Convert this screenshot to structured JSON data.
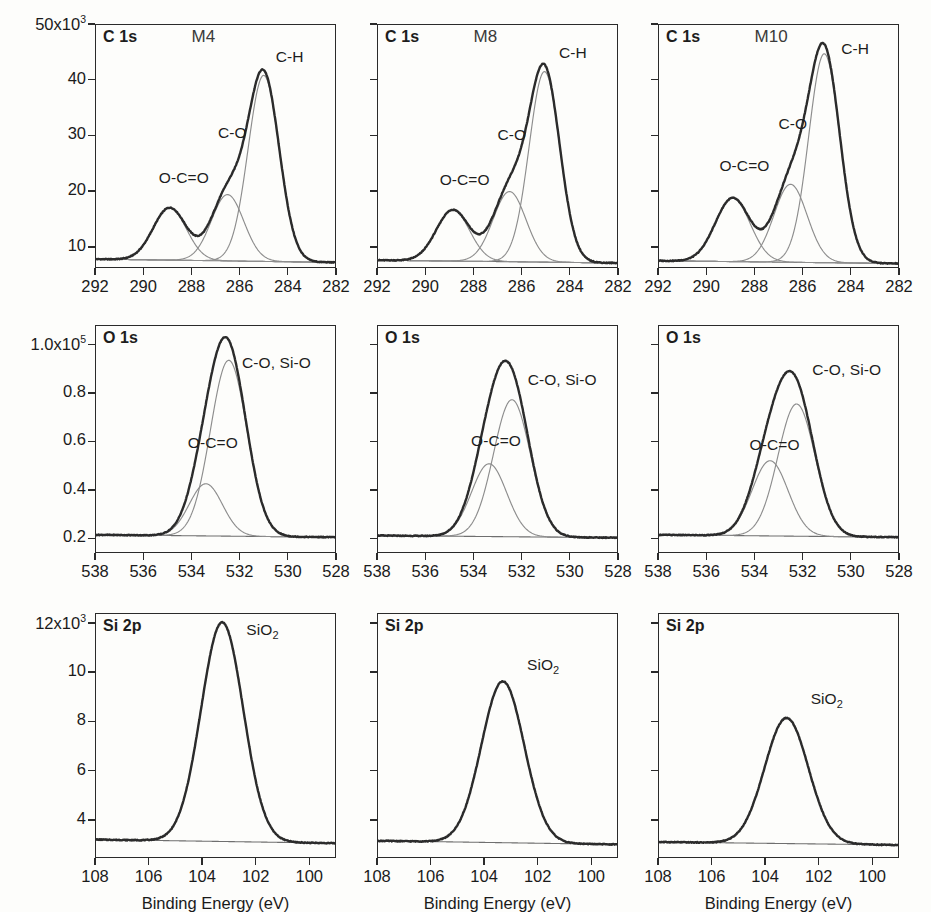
{
  "figure": {
    "width": 931,
    "height": 912,
    "background": "#fdfdfb",
    "envelope_color": "#2b2b2b",
    "component_color": "#8d8d8d",
    "baseline_color": "#6f6f6f",
    "axis_color": "#2a2a2a"
  },
  "axis_titles": {
    "y": "Intensity (CPS)",
    "x": "Binding Energy (eV)"
  },
  "samples": [
    "M4",
    "M8",
    "M10"
  ],
  "rows": [
    {
      "region": "C 1s",
      "x_ticks": [
        292,
        290,
        288,
        286,
        284,
        282
      ],
      "x_min": 282,
      "x_max": 292,
      "y_ticks": [
        "10",
        "20",
        "30",
        "40",
        "50x10"
      ],
      "y_exponent": "3",
      "y_tick_values": [
        10,
        20,
        30,
        40,
        50
      ],
      "y_min": 6.2,
      "y_max": 50,
      "components": [
        "O-C=O",
        "C-O",
        "C-H"
      ]
    },
    {
      "region": "O 1s",
      "x_ticks": [
        538,
        536,
        534,
        532,
        530,
        528
      ],
      "x_min": 528,
      "x_max": 538,
      "y_ticks": [
        "0.2",
        "0.4",
        "0.6",
        "0.8",
        "1.0x10"
      ],
      "y_exponent": "5",
      "y_tick_values": [
        0.2,
        0.4,
        0.6,
        0.8,
        1.0
      ],
      "y_min": 0.14,
      "y_max": 1.08,
      "components": [
        "O-C=O",
        "C-O, Si-O"
      ]
    },
    {
      "region": "Si 2p",
      "x_ticks": [
        108,
        106,
        104,
        102,
        100
      ],
      "x_min": 99,
      "x_max": 108,
      "y_ticks": [
        "4",
        "6",
        "8",
        "10",
        "12x10"
      ],
      "y_exponent": "3",
      "y_tick_values": [
        4,
        6,
        8,
        10,
        12
      ],
      "y_min": 2.45,
      "y_max": 12.4,
      "components": [
        "SiO2"
      ]
    }
  ],
  "chart_data": [
    {
      "type": "line",
      "panel_id": "c1s-m4",
      "title": "C 1s",
      "sample": "M4",
      "xlabel": "Binding Energy (eV)",
      "ylabel": "Intensity (CPS)",
      "xlim": [
        292,
        282
      ],
      "ylim": [
        6.2,
        50
      ],
      "y_scale": 1000,
      "baseline": {
        "left": 7.8,
        "right": 7.2
      },
      "series": [
        {
          "name": "O-C=O",
          "center": 288.9,
          "height": 9.4,
          "fwhm": 1.62,
          "label_x": 289.35,
          "label_y": 22.3
        },
        {
          "name": "C-O",
          "center": 286.5,
          "height": 11.9,
          "fwhm": 1.58,
          "label_x": 286.9,
          "label_y": 30.5
        },
        {
          "name": "C-H",
          "center": 285.0,
          "height": 33.4,
          "fwhm": 1.52,
          "label_x": 284.5,
          "label_y": 44.0
        }
      ],
      "envelope_peak": {
        "x": 285.0,
        "y": 44.3
      }
    },
    {
      "type": "line",
      "panel_id": "c1s-m8",
      "title": "C 1s",
      "sample": "M8",
      "xlim": [
        292,
        282
      ],
      "ylim": [
        6.2,
        50
      ],
      "y_scale": 1000,
      "baseline": {
        "left": 7.6,
        "right": 7.1
      },
      "series": [
        {
          "name": "O-C=O",
          "center": 288.85,
          "height": 9.2,
          "fwhm": 1.62,
          "label_x": 289.4,
          "label_y": 22.0
        },
        {
          "name": "C-O",
          "center": 286.5,
          "height": 12.6,
          "fwhm": 1.6,
          "label_x": 287.0,
          "label_y": 30.0
        },
        {
          "name": "C-H",
          "center": 285.05,
          "height": 34.2,
          "fwhm": 1.5,
          "label_x": 284.45,
          "label_y": 44.8
        }
      ],
      "envelope_peak": {
        "x": 285.05,
        "y": 45.2
      }
    },
    {
      "type": "line",
      "panel_id": "c1s-m10",
      "title": "C 1s",
      "sample": "M10",
      "xlim": [
        292,
        282
      ],
      "ylim": [
        6.2,
        50
      ],
      "y_scale": 1000,
      "baseline": {
        "left": 7.5,
        "right": 7.0
      },
      "series": [
        {
          "name": "O-C=O",
          "center": 288.9,
          "height": 11.4,
          "fwhm": 1.7,
          "label_x": 289.45,
          "label_y": 24.5
        },
        {
          "name": "C-O",
          "center": 286.5,
          "height": 14.0,
          "fwhm": 1.62,
          "label_x": 287.0,
          "label_y": 32.0
        },
        {
          "name": "C-H",
          "center": 285.1,
          "height": 37.5,
          "fwhm": 1.52,
          "label_x": 284.4,
          "label_y": 45.6
        }
      ],
      "envelope_peak": {
        "x": 285.1,
        "y": 47.5
      }
    },
    {
      "type": "line",
      "panel_id": "o1s-m4",
      "title": "O 1s",
      "sample": "M4",
      "xlim": [
        538,
        528
      ],
      "ylim": [
        0.14,
        1.08
      ],
      "y_scale": 100000,
      "baseline": {
        "left": 0.215,
        "right": 0.205
      },
      "series": [
        {
          "name": "O-C=O",
          "center": 533.4,
          "height": 0.215,
          "fwhm": 1.62,
          "label_x": 534.15,
          "label_y": 0.595
        },
        {
          "name": "C-O, Si-O",
          "center": 532.45,
          "height": 0.725,
          "fwhm": 1.78,
          "label_x": 531.9,
          "label_y": 0.925
        }
      ],
      "envelope_peak": {
        "x": 532.55,
        "y": 1.025
      }
    },
    {
      "type": "line",
      "panel_id": "o1s-m8",
      "title": "O 1s",
      "sample": "M8",
      "xlim": [
        538,
        528
      ],
      "ylim": [
        0.14,
        1.08
      ],
      "y_scale": 100000,
      "baseline": {
        "left": 0.212,
        "right": 0.203
      },
      "series": [
        {
          "name": "O-C=O",
          "center": 533.35,
          "height": 0.3,
          "fwhm": 1.72,
          "label_x": 534.1,
          "label_y": 0.6
        },
        {
          "name": "C-O, Si-O",
          "center": 532.4,
          "height": 0.565,
          "fwhm": 1.8,
          "label_x": 531.75,
          "label_y": 0.855
        },
        {
          "name": "envelope-only",
          "center": 0,
          "height": 0,
          "fwhm": 1,
          "label_x": 0,
          "label_y": 0
        }
      ],
      "envelope_peak": {
        "x": 532.5,
        "y": 0.96
      }
    },
    {
      "type": "line",
      "panel_id": "o1s-m10",
      "title": "O 1s",
      "sample": "M10",
      "xlim": [
        538,
        528
      ],
      "ylim": [
        0.14,
        1.08
      ],
      "y_scale": 100000,
      "baseline": {
        "left": 0.215,
        "right": 0.205
      },
      "series": [
        {
          "name": "O-C=O",
          "center": 533.35,
          "height": 0.31,
          "fwhm": 1.76,
          "label_x": 534.2,
          "label_y": 0.585
        },
        {
          "name": "C-O, Si-O",
          "center": 532.25,
          "height": 0.545,
          "fwhm": 1.82,
          "label_x": 531.6,
          "label_y": 0.895
        }
      ],
      "envelope_peak": {
        "x": 532.4,
        "y": 0.935
      }
    },
    {
      "type": "line",
      "panel_id": "si2p-m4",
      "title": "Si 2p",
      "sample": "M4",
      "xlim": [
        108,
        99
      ],
      "ylim": [
        2.45,
        12.4
      ],
      "y_scale": 1000,
      "baseline": {
        "left": 3.2,
        "right": 3.05
      },
      "series": [
        {
          "name": "SiO2",
          "center": 103.25,
          "height": 8.9,
          "fwhm": 1.85,
          "label_x": 102.35,
          "label_y": 11.7
        }
      ],
      "envelope_peak": {
        "x": 103.25,
        "y": 12.1
      }
    },
    {
      "type": "line",
      "panel_id": "si2p-m8",
      "title": "Si 2p",
      "sample": "M8",
      "xlim": [
        108,
        99
      ],
      "ylim": [
        2.45,
        12.4
      ],
      "y_scale": 1000,
      "baseline": {
        "left": 3.15,
        "right": 3.0
      },
      "series": [
        {
          "name": "SiO2",
          "center": 103.3,
          "height": 6.55,
          "fwhm": 1.88,
          "label_x": 102.4,
          "label_y": 10.3
        }
      ],
      "envelope_peak": {
        "x": 103.3,
        "y": 9.7
      }
    },
    {
      "type": "line",
      "panel_id": "si2p-m10",
      "title": "Si 2p",
      "sample": "M10",
      "xlim": [
        108,
        99
      ],
      "ylim": [
        2.45,
        12.4
      ],
      "y_scale": 1000,
      "baseline": {
        "left": 3.1,
        "right": 2.98
      },
      "series": [
        {
          "name": "SiO2",
          "center": 103.2,
          "height": 5.1,
          "fwhm": 1.92,
          "label_x": 102.3,
          "label_y": 8.9
        }
      ],
      "envelope_peak": {
        "x": 103.2,
        "y": 8.2
      }
    }
  ],
  "layout": {
    "panel_left": [
      95,
      377,
      658
    ],
    "panel_width": 241,
    "panel_top": [
      24,
      325,
      613
    ],
    "panel_height": 244,
    "row_heights": [
      244,
      228,
      245
    ]
  }
}
